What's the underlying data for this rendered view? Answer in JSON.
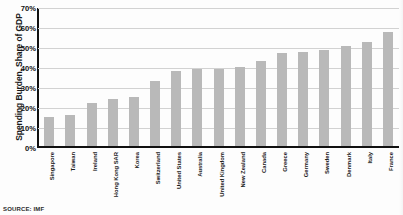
{
  "chart_data": {
    "type": "bar",
    "title": "",
    "xlabel": "",
    "ylabel": "Spending Burden, Share of GDP",
    "ylim": [
      0,
      70
    ],
    "ytick_labels": [
      "70%",
      "60%",
      "50%",
      "40%",
      "30%",
      "20%",
      "10%",
      "0%"
    ],
    "ytick_values": [
      70,
      60,
      50,
      40,
      30,
      20,
      10,
      0
    ],
    "grid": true,
    "legend": "none",
    "bar_color": "#b9b9b9",
    "categories": [
      "Singapore",
      "Taiwan",
      "Ireland",
      "Hong Kong SAR",
      "Korea",
      "Switzerland",
      "United States",
      "Australia",
      "United Kingdom",
      "New Zealand",
      "Canada",
      "Greece",
      "Germany",
      "Sweden",
      "Denmark",
      "Italy",
      "France"
    ],
    "values": [
      15,
      16,
      22,
      24,
      25,
      33,
      38,
      39,
      39,
      40,
      43,
      47,
      48,
      49,
      51,
      53,
      58
    ]
  },
  "axis": {
    "y_title": "Spending Burden, Share of GDP"
  },
  "footer": {
    "source": "SOURCE: IMF"
  }
}
